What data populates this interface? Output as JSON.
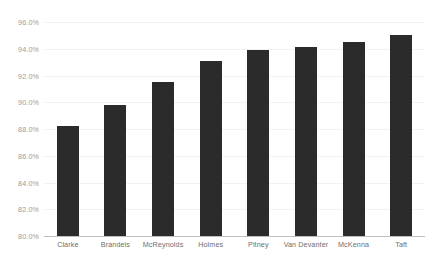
{
  "chart_data": {
    "type": "bar",
    "title": "",
    "subtitle": "",
    "xlabel": "",
    "ylabel": "",
    "ylim": [
      80.0,
      96.0
    ],
    "ytick_step": 2.0,
    "ytick_labels": [
      "96.0%",
      "94.0%",
      "92.0%",
      "90.0%",
      "88.0%",
      "86.0%",
      "84.0%",
      "82.0%",
      "80.0%"
    ],
    "ytick_values": [
      96.0,
      94.0,
      92.0,
      90.0,
      88.0,
      86.0,
      84.0,
      82.0,
      80.0
    ],
    "grid": true,
    "legend": "none",
    "value_unit": "%",
    "categories": [
      "Clarke",
      "Brandeis",
      "McReynolds",
      "Holmes",
      "Pitney",
      "Van Devanter",
      "McKenna",
      "Taft"
    ],
    "values": [
      88.2,
      89.8,
      91.5,
      93.1,
      93.9,
      94.1,
      94.5,
      95.0
    ],
    "bar_color": "#2b2b2b",
    "grid_color": "#f2f2f2",
    "axis_color": "#bfbfbf",
    "tick_label_color": "#9a9a9a",
    "category_label_color": "#6e6e6e"
  }
}
